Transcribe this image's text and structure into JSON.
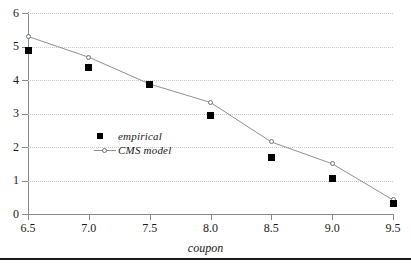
{
  "chart_data": {
    "type": "scatter",
    "title": "",
    "subtitle": "",
    "xlabel": "coupon",
    "ylabel": "",
    "xlim": [
      6.5,
      9.5
    ],
    "ylim": [
      0,
      6
    ],
    "grid": true,
    "grid_orientation": "horizontal",
    "legend_position": "inner-lower-left",
    "x": [
      6.5,
      7.0,
      7.5,
      8.0,
      8.5,
      9.0,
      9.5
    ],
    "xticks": [
      "6.5",
      "7.0",
      "7.5",
      "8.0",
      "8.5",
      "9.0",
      "9.5"
    ],
    "yticks": [
      "0",
      "1",
      "2",
      "3",
      "4",
      "5",
      "6"
    ],
    "series": [
      {
        "name": "empirical",
        "marker": "filled-square",
        "color": "#000000",
        "line": false,
        "values": [
          4.88,
          4.36,
          3.88,
          2.95,
          1.7,
          1.05,
          0.3
        ]
      },
      {
        "name": "CMS model",
        "marker": "open-circle",
        "color": "#909090",
        "line": true,
        "values": [
          5.3,
          4.68,
          3.88,
          3.33,
          2.15,
          1.5,
          0.42
        ]
      }
    ]
  },
  "legend": {
    "entries": [
      {
        "label": "empirical",
        "key": "filled-square"
      },
      {
        "label": "CMS model",
        "key": "line-open-circle"
      }
    ]
  },
  "axis": {
    "x_title": "coupon"
  }
}
